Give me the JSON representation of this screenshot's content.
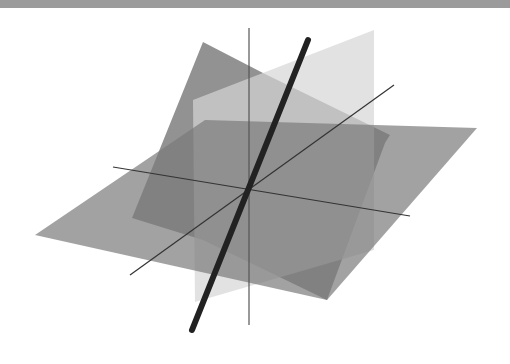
{
  "figure": {
    "top_bar_color": "#9b9b9b",
    "background": "#ffffff"
  },
  "planes": [
    {
      "name": "tilted-dark-plane",
      "fill": "#6e6e6e",
      "opacity": 0.75,
      "points": "203,42 263,73 390,135 385,143 327,300 203,240 132,218"
    },
    {
      "name": "vertical-light-plane",
      "fill": "#d6d6d6",
      "opacity": 0.7,
      "points": "193,100 374,30 374,250 195,302"
    },
    {
      "name": "horizontal-plane",
      "fill": "#7a7a7a",
      "opacity": 0.7,
      "points": "35,235 205,120 477,128 327,300"
    }
  ],
  "axes": [
    {
      "name": "z-axis",
      "x1": 249,
      "y1": 28,
      "x2": 249,
      "y2": 325,
      "stroke": "#555555",
      "width": 1.2
    },
    {
      "name": "x-axis",
      "x1": 113,
      "y1": 167,
      "x2": 410,
      "y2": 216,
      "stroke": "#333333",
      "width": 1.2
    },
    {
      "name": "y-axis",
      "x1": 130,
      "y1": 275,
      "x2": 394,
      "y2": 85,
      "stroke": "#333333",
      "width": 1.2
    }
  ],
  "rod": {
    "name": "intersection-line",
    "x1": 308,
    "y1": 40,
    "x2": 192,
    "y2": 330,
    "stroke": "#222222",
    "width": 6
  },
  "origin": {
    "x": 249,
    "y": 185
  }
}
